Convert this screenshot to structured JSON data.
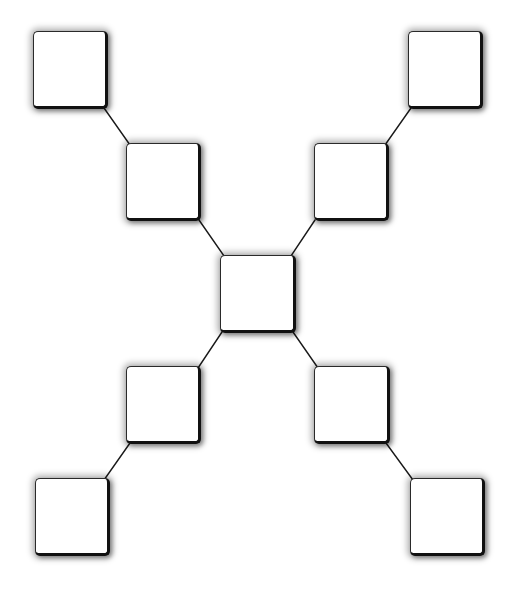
{
  "diagram": {
    "type": "x-shaped hierarchy (empty boxes)",
    "canvas": {
      "width": 522,
      "height": 594,
      "background": "#ffffff"
    },
    "style": {
      "box_fill": "#ffffff",
      "box_border": "#111111",
      "connector_color": "#1a1a1a",
      "connector_width": 1.4
    },
    "nodes": [
      {
        "id": "top-left",
        "x": 33,
        "y": 31,
        "w": 75,
        "h": 78,
        "label": ""
      },
      {
        "id": "upper-left-mid",
        "x": 126,
        "y": 143,
        "w": 75,
        "h": 78,
        "label": ""
      },
      {
        "id": "top-right",
        "x": 408,
        "y": 31,
        "w": 75,
        "h": 78,
        "label": ""
      },
      {
        "id": "upper-right-mid",
        "x": 314,
        "y": 143,
        "w": 75,
        "h": 78,
        "label": ""
      },
      {
        "id": "center",
        "x": 220,
        "y": 255,
        "w": 76,
        "h": 78,
        "label": ""
      },
      {
        "id": "lower-left-mid",
        "x": 126,
        "y": 366,
        "w": 75,
        "h": 78,
        "label": ""
      },
      {
        "id": "lower-right-mid",
        "x": 314,
        "y": 366,
        "w": 76,
        "h": 78,
        "label": ""
      },
      {
        "id": "bottom-left",
        "x": 35,
        "y": 478,
        "w": 75,
        "h": 78,
        "label": ""
      },
      {
        "id": "bottom-right",
        "x": 410,
        "y": 478,
        "w": 75,
        "h": 78,
        "label": ""
      }
    ],
    "edges": [
      {
        "from": "top-left",
        "to": "upper-left-mid",
        "x1": 104,
        "y1": 108,
        "x2": 130,
        "y2": 145
      },
      {
        "from": "upper-left-mid",
        "to": "center",
        "x1": 199,
        "y1": 220,
        "x2": 224,
        "y2": 256
      },
      {
        "from": "top-right",
        "to": "upper-right-mid",
        "x1": 411,
        "y1": 108,
        "x2": 385,
        "y2": 145
      },
      {
        "from": "upper-right-mid",
        "to": "center",
        "x1": 315,
        "y1": 220,
        "x2": 291,
        "y2": 256
      },
      {
        "from": "center",
        "to": "lower-left-mid",
        "x1": 222,
        "y1": 332,
        "x2": 198,
        "y2": 368
      },
      {
        "from": "center",
        "to": "lower-right-mid",
        "x1": 293,
        "y1": 332,
        "x2": 318,
        "y2": 368
      },
      {
        "from": "lower-left-mid",
        "to": "bottom-left",
        "x1": 130,
        "y1": 443,
        "x2": 104,
        "y2": 480
      },
      {
        "from": "lower-right-mid",
        "to": "bottom-right",
        "x1": 386,
        "y1": 443,
        "x2": 413,
        "y2": 480
      }
    ]
  }
}
